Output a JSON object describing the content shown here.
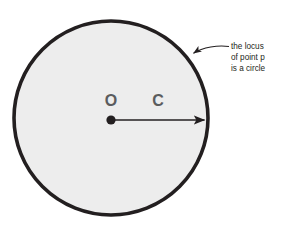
{
  "figure": {
    "background_color": "#ffffff"
  },
  "circle": {
    "fill_color": "#ededed",
    "stroke_color": "#231f20",
    "stroke_width": 3.6,
    "center_x": 111,
    "center_y": 118,
    "radius": 97
  },
  "center_point": {
    "label": "O",
    "color": "#231f20",
    "x": 111,
    "y": 120,
    "radius": 4.6
  },
  "radius_arrow": {
    "label": "C",
    "color": "#231f20",
    "from_x": 111,
    "from_y": 120,
    "to_x": 207,
    "to_y": 120
  },
  "labels": [
    {
      "name": "center-label",
      "text": "O",
      "x": 111,
      "y": 106,
      "color": "#5b5c5e"
    },
    {
      "name": "radius-label",
      "text": "C",
      "x": 158,
      "y": 106,
      "color": "#5b5c5e"
    }
  ],
  "annotation": {
    "lines": [
      "the locus",
      "of point p",
      "is a circle"
    ],
    "color": "#231f20",
    "text_x": 231,
    "line1_y": 49,
    "line2_y": 60,
    "line3_y": 71,
    "leader_color": "#231f20",
    "leader_tip_x": 190,
    "leader_tip_y": 55
  }
}
